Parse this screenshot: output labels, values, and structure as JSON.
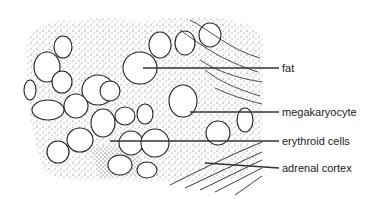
{
  "diagram": {
    "type": "histology-illustration",
    "labels": [
      {
        "id": "fat",
        "text": "fat",
        "x": 282,
        "y": 62,
        "leader": {
          "x1": 143,
          "y1": 68,
          "x2": 279,
          "y2": 68
        }
      },
      {
        "id": "megakaryocyte",
        "text": "megakaryocyte",
        "x": 282,
        "y": 104,
        "leader": {
          "x1": 190,
          "y1": 112,
          "x2": 279,
          "y2": 112
        }
      },
      {
        "id": "erythroid",
        "text": "erythroid cells",
        "x": 282,
        "y": 133,
        "leader": {
          "x1": 110,
          "y1": 141,
          "x2": 279,
          "y2": 141
        }
      },
      {
        "id": "adrenal",
        "text": "adrenal cortex",
        "x": 282,
        "y": 161,
        "leader": {
          "x1": 205,
          "y1": 163,
          "x2": 279,
          "y2": 168
        }
      }
    ],
    "colors": {
      "ink": "#222222",
      "stipple": "#555555",
      "background": "#ffffff"
    }
  }
}
